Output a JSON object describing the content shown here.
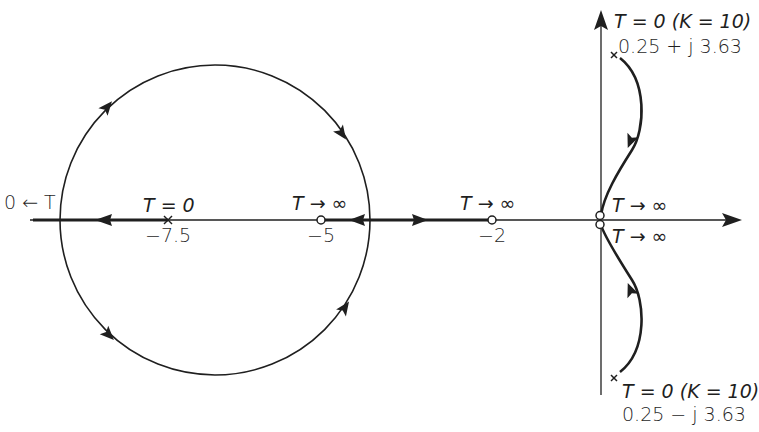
{
  "diagram": {
    "type": "root-locus",
    "axes": {
      "real_axis": {
        "y": 220,
        "x_start": 30,
        "x_end": 742,
        "arrow": "right"
      },
      "imag_axis": {
        "x": 601,
        "y_start": 395,
        "y_end": 10,
        "arrow": "up"
      }
    },
    "circle": {
      "center_label": "-5 region",
      "cx": 215,
      "cy": 220,
      "r": 155
    },
    "poles": [
      {
        "id": "pole-neg-7.5",
        "value": "-7.5",
        "x": 168,
        "y": 220
      },
      {
        "id": "pole-upper",
        "value": "0.25 + j 3.63",
        "x": 614,
        "y": 55
      },
      {
        "id": "pole-lower",
        "value": "0.25 - j 3.63",
        "x": 614,
        "y": 378
      }
    ],
    "zeros": [
      {
        "id": "zero-neg-5",
        "value": "-5",
        "x": 321,
        "y": 220
      },
      {
        "id": "zero-neg-2",
        "value": "-2",
        "x": 492,
        "y": 220
      },
      {
        "id": "zero-origin-upper",
        "value": "0",
        "x": 600,
        "y": 215
      },
      {
        "id": "zero-origin-lower",
        "value": "0",
        "x": 600,
        "y": 225
      }
    ],
    "colors": {
      "ink": "#1f1f1f",
      "background": "#ffffff"
    }
  },
  "labels": {
    "left_end": {
      "text": "0 ← T"
    },
    "pole_m75_top": "T = 0",
    "pole_m75_bottom": "−7.5",
    "zero_m5_top": "T → ∞",
    "zero_m5_bottom": "−5",
    "zero_m2_top": "T → ∞",
    "zero_m2_bottom": "−2",
    "origin_upper": "T → ∞",
    "origin_lower": "T → ∞",
    "upper_pole_line1": "T = 0  (K = 10)",
    "upper_pole_line2": "0.25 + j 3.63",
    "lower_pole_line1": "T = 0  (K = 10)",
    "lower_pole_line2": "0.25 − j 3.63"
  }
}
